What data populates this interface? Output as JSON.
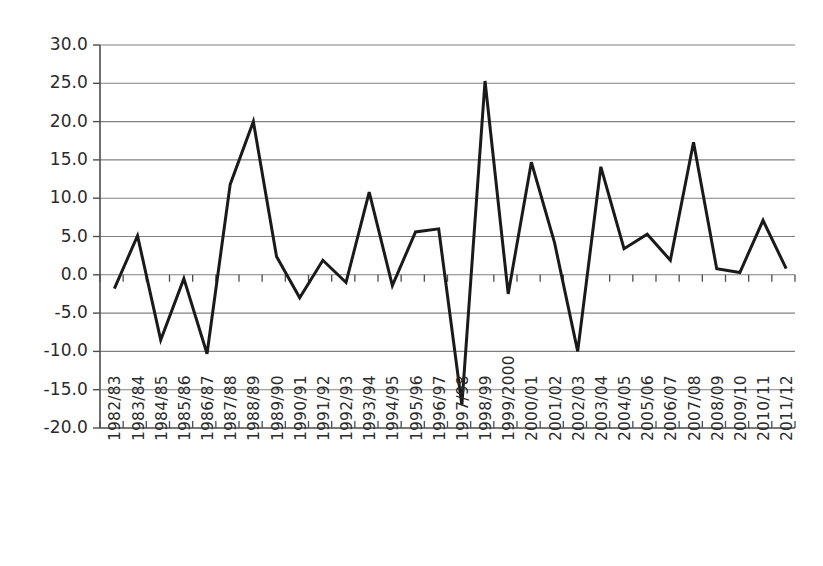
{
  "chart_data": {
    "type": "line",
    "title": "",
    "subtitle": "",
    "xlabel": "",
    "ylabel": "",
    "grid": true,
    "legend": false,
    "legend_position": "none",
    "line_color": "#1a1a1a",
    "grid_color": "#808080",
    "axis_color": "#4d4d4d",
    "background": "#ffffff",
    "xlim": [
      0,
      29
    ],
    "ylim": [
      -20.0,
      30.0
    ],
    "ytick_labels": [
      "30.0",
      "25.0",
      "20.0",
      "15.0",
      "10.0",
      "5.0",
      "0.0",
      "-5.0",
      "-10.0",
      "-15.0",
      "-20.0"
    ],
    "yticks": [
      30.0,
      25.0,
      20.0,
      15.0,
      10.0,
      5.0,
      0.0,
      -5.0,
      -10.0,
      -15.0,
      -20.0
    ],
    "categories": [
      "1982/83",
      "1983/84",
      "1984/85",
      "1985/86",
      "1986/87",
      "1987/88",
      "1988/89",
      "1989/90",
      "1990/91",
      "1991/92",
      "1992/93",
      "1993/94",
      "1994/95",
      "1995/96",
      "1996/97",
      "1997/98",
      "1998/99",
      "1999/2000",
      "2000/01",
      "2001/02",
      "2002/03",
      "2003/04",
      "2004/05",
      "2005/06",
      "2006/07",
      "2007/08",
      "2008/09",
      "2009/10",
      "2010/11",
      "2011/12"
    ],
    "series": [
      {
        "name": "Annual change",
        "values": [
          -1.8,
          5.1,
          -8.5,
          -0.5,
          -10.3,
          11.8,
          20.0,
          2.4,
          -3.0,
          1.9,
          -1.0,
          10.8,
          -1.4,
          5.6,
          6.0,
          -17.0,
          25.3,
          -2.5,
          14.7,
          4.2,
          -10.0,
          14.1,
          3.4,
          5.3,
          1.9,
          17.3,
          0.8,
          0.3,
          7.1,
          0.8
        ]
      }
    ]
  }
}
